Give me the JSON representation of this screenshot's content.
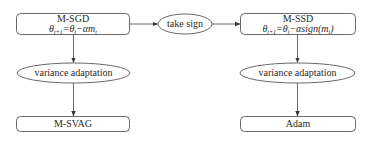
{
  "diagram": {
    "nodes": {
      "msgd": {
        "title": "M-SGD",
        "eq_lhs": "θ",
        "eq_lhs_sub": "t+1",
        "eq_mid": "=θ",
        "eq_mid_sub": "t",
        "eq_rhs": "−αm",
        "eq_rhs_sub": "t",
        "shape": "rounded-rect"
      },
      "take_sign": {
        "label": "take sign",
        "shape": "ellipse"
      },
      "mssd": {
        "title": "M-SSD",
        "eq_lhs": "θ",
        "eq_lhs_sub": "t+1",
        "eq_mid": "=θ",
        "eq_mid_sub": "t",
        "eq_rhs": "−αsign(m",
        "eq_rhs_sub": "t",
        "eq_tail": ")",
        "shape": "rounded-rect"
      },
      "var_left": {
        "label": "variance adaptation",
        "shape": "ellipse"
      },
      "var_right": {
        "label": "variance adaptation",
        "shape": "ellipse"
      },
      "msvag": {
        "label": "M-SVAG",
        "shape": "rounded-rect"
      },
      "adam": {
        "label": "Adam",
        "shape": "rounded-rect"
      }
    },
    "edges": [
      {
        "from": "M-SGD",
        "to": "take sign"
      },
      {
        "from": "take sign",
        "to": "M-SSD"
      },
      {
        "from": "M-SGD",
        "to": "variance adaptation (left)"
      },
      {
        "from": "variance adaptation (left)",
        "to": "M-SVAG"
      },
      {
        "from": "M-SSD",
        "to": "variance adaptation (right)"
      },
      {
        "from": "variance adaptation (right)",
        "to": "Adam"
      }
    ],
    "colors": {
      "stroke": "#333333",
      "text": "#2a2a2a",
      "background": "#ffffff"
    }
  }
}
